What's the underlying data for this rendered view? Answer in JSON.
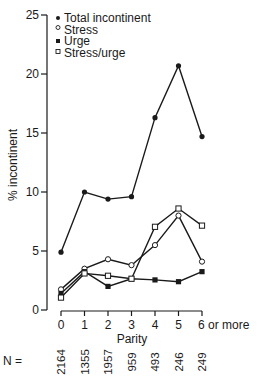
{
  "chart_data": {
    "type": "line",
    "title": "",
    "xlabel": "Parity",
    "ylabel": "% incontinent",
    "categories": [
      "0",
      "1",
      "2",
      "3",
      "4",
      "5",
      "6 or more"
    ],
    "ylim": [
      0,
      25
    ],
    "yticks": [
      0,
      5,
      10,
      15,
      20,
      25
    ],
    "grid": false,
    "legend_position": "top-left",
    "series": [
      {
        "name": "Total incontinent",
        "marker": "filled-circle",
        "values": [
          4.9,
          10.0,
          9.4,
          9.6,
          16.3,
          20.7,
          14.7
        ]
      },
      {
        "name": "Stress",
        "marker": "open-circle",
        "values": [
          1.75,
          3.5,
          4.3,
          3.8,
          5.5,
          8.0,
          4.1
        ]
      },
      {
        "name": "Urge",
        "marker": "filled-square",
        "values": [
          1.4,
          3.25,
          2.0,
          2.65,
          2.55,
          2.4,
          3.25
        ]
      },
      {
        "name": "Stress/urge",
        "marker": "open-square",
        "values": [
          1.05,
          3.1,
          2.9,
          2.65,
          7.05,
          8.6,
          7.15
        ]
      }
    ],
    "sample_sizes": {
      "label": "N =",
      "values": [
        "2164",
        "1355",
        "1957",
        "959",
        "493",
        "246",
        "249"
      ]
    }
  }
}
